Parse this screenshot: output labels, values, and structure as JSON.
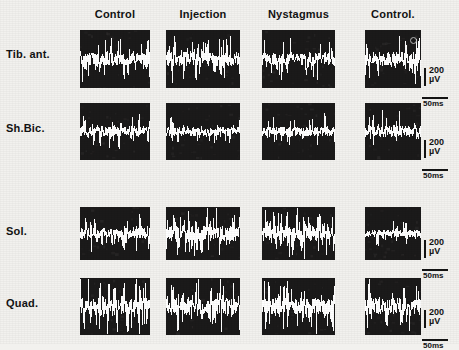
{
  "figure": {
    "background_color": "#f2f1ee",
    "panel_color": "#1b1a1a",
    "trace_color": "#ffffff",
    "ink_color": "#131313"
  },
  "columns": [
    {
      "id": "control-1",
      "label": "Control"
    },
    {
      "id": "injection",
      "label": "Injection"
    },
    {
      "id": "nystagmus",
      "label": "Nystagmus"
    },
    {
      "id": "control-2",
      "label": "Control."
    }
  ],
  "rows": [
    {
      "id": "tib-ant",
      "label": "Tib. ant."
    },
    {
      "id": "sh-bic",
      "label": "Sh.Bic."
    },
    {
      "id": "sol",
      "label": "Sol."
    },
    {
      "id": "quad",
      "label": "Quad."
    }
  ],
  "scale_bars": [
    {
      "id": "scalebar-tib-ant",
      "amplitude": "200",
      "amplitude_unit": "µV",
      "time": "50ms"
    },
    {
      "id": "scalebar-sh-bic",
      "amplitude": "200",
      "amplitude_unit": "µV",
      "time": "50ms"
    },
    {
      "id": "scalebar-sol",
      "amplitude": "200",
      "amplitude_unit": "µV",
      "time": "50ms"
    },
    {
      "id": "scalebar-quad",
      "amplitude": "200",
      "amplitude_unit": "µV",
      "time": "50ms"
    }
  ],
  "chart_data": {
    "type": "line",
    "xlabel": "Time",
    "ylabel": "EMG amplitude",
    "grid": false,
    "legend": "none",
    "x_scale_per_panel": "50ms",
    "y_scale_per_panel": "200 µV",
    "categories": [
      "Control",
      "Injection",
      "Nystagmus",
      "Control."
    ],
    "series": [
      {
        "name": "Tib. ant.",
        "panels": [
          {
            "condition": "Control",
            "rms_amplitude_uv": 62,
            "baseline_offset": 0,
            "spike_density": 0.55,
            "seed": 1101
          },
          {
            "condition": "Injection",
            "rms_amplitude_uv": 70,
            "baseline_offset": 0,
            "spike_density": 0.6,
            "seed": 1102
          },
          {
            "condition": "Nystagmus",
            "rms_amplitude_uv": 58,
            "baseline_offset": 0,
            "spike_density": 0.52,
            "seed": 1103
          },
          {
            "condition": "Control.",
            "rms_amplitude_uv": 66,
            "baseline_offset": 0,
            "spike_density": 0.58,
            "seed": 1104
          }
        ]
      },
      {
        "name": "Sh.Bic.",
        "panels": [
          {
            "condition": "Control",
            "rms_amplitude_uv": 48,
            "baseline_offset": 0,
            "spike_density": 0.45,
            "seed": 2101
          },
          {
            "condition": "Injection",
            "rms_amplitude_uv": 42,
            "baseline_offset": 0,
            "spike_density": 0.4,
            "seed": 2102
          },
          {
            "condition": "Nystagmus",
            "rms_amplitude_uv": 46,
            "baseline_offset": 0,
            "spike_density": 0.43,
            "seed": 2103
          },
          {
            "condition": "Control.",
            "rms_amplitude_uv": 55,
            "baseline_offset": 0,
            "spike_density": 0.5,
            "seed": 2104
          }
        ]
      },
      {
        "name": "Sol.",
        "panels": [
          {
            "condition": "Control",
            "rms_amplitude_uv": 55,
            "baseline_offset": 0,
            "spike_density": 0.48,
            "seed": 3101
          },
          {
            "condition": "Injection",
            "rms_amplitude_uv": 135,
            "baseline_offset": 0,
            "spike_density": 0.92,
            "seed": 3102
          },
          {
            "condition": "Nystagmus",
            "rms_amplitude_uv": 150,
            "baseline_offset": 0,
            "spike_density": 0.95,
            "seed": 3103
          },
          {
            "condition": "Control.",
            "rms_amplitude_uv": 40,
            "baseline_offset": 0,
            "spike_density": 0.35,
            "seed": 3104
          }
        ]
      },
      {
        "name": "Quad.",
        "panels": [
          {
            "condition": "Control",
            "rms_amplitude_uv": 95,
            "baseline_offset": 0,
            "spike_density": 0.72,
            "seed": 4101
          },
          {
            "condition": "Injection",
            "rms_amplitude_uv": 145,
            "baseline_offset": 0,
            "spike_density": 0.93,
            "seed": 4102
          },
          {
            "condition": "Nystagmus",
            "rms_amplitude_uv": 120,
            "baseline_offset": 0,
            "spike_density": 0.85,
            "seed": 4103
          },
          {
            "condition": "Control.",
            "rms_amplitude_uv": 80,
            "baseline_offset": 0,
            "spike_density": 0.66,
            "seed": 4104
          }
        ]
      }
    ]
  },
  "layout": {
    "panel_x": [
      80,
      166,
      262,
      365
    ],
    "panel_w": [
      70,
      74,
      73,
      56
    ],
    "row_y": [
      30,
      103,
      207,
      278
    ],
    "row_h": [
      58,
      57,
      53,
      57
    ],
    "header_y": 8,
    "row_label_x": 6,
    "row_label_y": [
      48,
      122,
      225,
      297
    ],
    "scalebar_x": [
      424,
      424,
      424,
      424
    ],
    "scalebar_y": [
      68,
      140,
      240,
      310
    ],
    "scalebar_vert_h": 18,
    "scalebar_horiz_w": 26
  },
  "annotations": [
    {
      "id": "lens-artifact-dot",
      "panel": "Tib. ant. / Control.",
      "x": 410,
      "y": 37
    }
  ]
}
